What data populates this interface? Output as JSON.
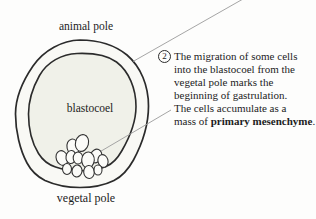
{
  "figure": {
    "labels": {
      "animal_pole": "animal pole",
      "blastocoel": "blastocoel",
      "vegetal_pole": "vegetal pole"
    },
    "annotation": {
      "step_number": "2",
      "lines": [
        "The migration of some cells",
        "into the blastocoel from the",
        "vegetal pole marks the",
        "beginning of gastrulation.",
        "The cells accumulate as a"
      ],
      "last_line": {
        "prefix": "mass of ",
        "bold": "primary mesenchyme",
        "suffix": "."
      }
    },
    "colors": {
      "ink": "#1c1c1c",
      "outline": "#2b2b2b",
      "pointer_line": "#9b9b9b",
      "blastocoel_fill": "#f0f1e9",
      "wall_fill": "#f9f9f5",
      "background": "#fdfdfc"
    }
  }
}
